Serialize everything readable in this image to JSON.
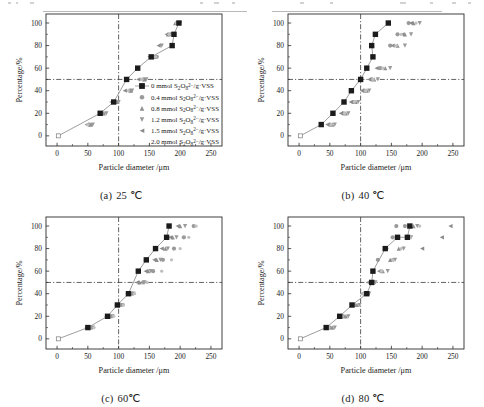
{
  "figure": {
    "type": "multi-panel-scientific-figure",
    "panel_count": 4,
    "layout": "2x2"
  },
  "axis": {
    "xlabel_main": "Particle diameter",
    "xlabel_unit": "/μm",
    "ylabel_main": "Percentage",
    "ylabel_unit": "/%",
    "xticks": [
      "0",
      "50",
      "100",
      "150",
      "200",
      "250"
    ],
    "yticks": [
      "0",
      "20",
      "40",
      "60",
      "80",
      "100"
    ],
    "xlim": [
      -18,
      268
    ],
    "ylim": [
      -9,
      108
    ],
    "ref_line_y": 50,
    "ref_line_x": 100
  },
  "legend": {
    "entries": [
      {
        "marker": "square",
        "color": "#1b1b1b",
        "conc": "0",
        "unit": "mmol",
        "species_a": "S",
        "species_sub1": "2",
        "species_b": "O",
        "species_sub2": "8",
        "species_sup": "2−",
        "per": "/g·VSS",
        "label": "0 mmol S2O8 2- /g·VSS"
      },
      {
        "marker": "circle",
        "color": "#9a9a9a",
        "conc": "0.4",
        "unit": "mmol",
        "species_a": "S",
        "species_sub1": "2",
        "species_b": "O",
        "species_sub2": "8",
        "species_sup": "2−",
        "per": "/g·VSS",
        "label": "0.4 mmol S2O8 2- /g·VSS"
      },
      {
        "marker": "triangle-up",
        "color": "#8f8f8f",
        "conc": "0.8",
        "unit": "mmol",
        "species_a": "S",
        "species_sub1": "2",
        "species_b": "O",
        "species_sub2": "8",
        "species_sup": "2−",
        "per": "/g·VSS",
        "label": "0.8 mmol S2O8 2- /g·VSS"
      },
      {
        "marker": "triangle-down",
        "color": "#9a9a9a",
        "conc": "1.2",
        "unit": "mmol",
        "species_a": "S",
        "species_sub1": "2",
        "species_b": "O",
        "species_sub2": "8",
        "species_sup": "2−",
        "per": "/g·VSS",
        "label": "1.2 mmol S2O8 2- /g·VSS"
      },
      {
        "marker": "triangle-left",
        "color": "#8a8a8a",
        "conc": "1.5",
        "unit": "mmol",
        "species_a": "S",
        "species_sub1": "2",
        "species_b": "O",
        "species_sub2": "8",
        "species_sup": "2−",
        "per": "/g·VSS",
        "label": "1.5 mmol S2O8 2- /g·VSS"
      },
      {
        "marker": "none",
        "color": "#bdbdbd",
        "conc": "2.0",
        "unit": "mmol",
        "species_a": "S",
        "species_sub1": "2",
        "species_b": "O",
        "species_sub2": "8",
        "species_sup": "2−",
        "per": "/g·VSS",
        "label": "2.0 mmol S2O8 2- /g·VSS"
      }
    ]
  },
  "panels": [
    {
      "id": "a",
      "caption_label": "(a)",
      "caption_value": "25 ℃",
      "has_legend": true,
      "chart_data": {
        "type": "line",
        "title": "(a) 25 ℃",
        "xlabel": "Particle diameter /μm",
        "ylabel": "Percentage /%",
        "xlim": [
          -18,
          268
        ],
        "ylim": [
          -9,
          108
        ],
        "grid": false,
        "legend_position": "lower-right-inside",
        "reference_lines": {
          "horizontal_y": 50,
          "vertical_x": 100,
          "style": "dash-dot"
        },
        "series": [
          {
            "name": "0 mmol S2O8 2- /g·VSS",
            "marker": "square",
            "color": "#1b1b1b",
            "connected": true,
            "x": [
              2,
              70,
              92,
              113,
              131,
              153,
              187,
              190,
              198
            ],
            "y": [
              0,
              20,
              30,
              50,
              60,
              70,
              80,
              90,
              100
            ]
          },
          {
            "name": "0.4 mmol S2O8 2- /g·VSS",
            "marker": "circle",
            "color": "#9a9a9a",
            "connected": false,
            "x": [
              52,
              74,
              96,
              118,
              140,
              162,
              184,
              196
            ],
            "y": [
              10,
              20,
              30,
              40,
              50,
              70,
              90,
              100
            ]
          },
          {
            "name": "0.8 mmol S2O8 2- /g·VSS",
            "marker": "triangle-up",
            "color": "#8f8f8f",
            "connected": false,
            "x": [
              55,
              76,
              98,
              120,
              142,
              158,
              180,
              192
            ],
            "y": [
              10,
              20,
              30,
              40,
              50,
              70,
              90,
              100
            ]
          },
          {
            "name": "1.2 mmol S2O8 2- /g·VSS",
            "marker": "triangle-down",
            "color": "#9a9a9a",
            "connected": false,
            "x": [
              58,
              80,
              100,
              122,
              145,
              170,
              188,
              200
            ],
            "y": [
              10,
              20,
              30,
              40,
              50,
              80,
              90,
              100
            ]
          },
          {
            "name": "1.5 mmol S2O8 2- /g·VSS",
            "marker": "triangle-left",
            "color": "#8a8a8a",
            "connected": false,
            "x": [
              48,
              70,
              88,
              110,
              132,
              150,
              165,
              178
            ],
            "y": [
              10,
              20,
              30,
              40,
              50,
              70,
              80,
              90
            ]
          },
          {
            "name": "2.0 mmol S2O8 2- /g·VSS",
            "marker": "dot",
            "color": "#c0c0c0",
            "connected": false,
            "x": [
              50,
              72,
              94,
              116,
              138,
              160,
              182,
              194
            ],
            "y": [
              10,
              20,
              30,
              40,
              50,
              70,
              90,
              100
            ]
          }
        ]
      }
    },
    {
      "id": "b",
      "caption_label": "(b)",
      "caption_value": "40 ℃",
      "has_legend": false,
      "chart_data": {
        "type": "line",
        "title": "(b) 40 ℃",
        "xlabel": "Particle diameter /μm",
        "ylabel": "Percentage /%",
        "xlim": [
          -18,
          268
        ],
        "ylim": [
          -9,
          108
        ],
        "grid": false,
        "reference_lines": {
          "horizontal_y": 50,
          "vertical_x": 100,
          "style": "dash-dot"
        },
        "series": [
          {
            "name": "0 mmol S2O8 2- /g·VSS",
            "marker": "square",
            "color": "#1b1b1b",
            "connected": true,
            "x": [
              2,
              36,
              55,
              73,
              85,
              100,
              110,
              120,
              118,
              124,
              145
            ],
            "y": [
              0,
              10,
              20,
              30,
              40,
              50,
              60,
              70,
              80,
              90,
              100
            ]
          },
          {
            "name": "0.4 mmol S2O8 2- /g·VSS",
            "marker": "circle",
            "color": "#9a9a9a",
            "connected": false,
            "x": [
              50,
              72,
              88,
              106,
              118,
              132,
              148,
              160,
              178
            ],
            "y": [
              10,
              20,
              30,
              40,
              50,
              60,
              80,
              90,
              100
            ]
          },
          {
            "name": "0.8 mmol S2O8 2- /g·VSS",
            "marker": "triangle-up",
            "color": "#8f8f8f",
            "connected": false,
            "x": [
              54,
              76,
              92,
              110,
              122,
              140,
              160,
              172,
              186
            ],
            "y": [
              10,
              20,
              30,
              40,
              50,
              60,
              80,
              90,
              100
            ]
          },
          {
            "name": "1.2 mmol S2O8 2- /g·VSS",
            "marker": "triangle-down",
            "color": "#9a9a9a",
            "connected": false,
            "x": [
              58,
              80,
              96,
              114,
              128,
              148,
              172,
              182,
              196
            ],
            "y": [
              10,
              20,
              30,
              40,
              50,
              60,
              80,
              90,
              100
            ]
          },
          {
            "name": "1.5 mmol S2O8 2- /g·VSS",
            "marker": "triangle-left",
            "color": "#8a8a8a",
            "connected": false,
            "x": [
              46,
              68,
              84,
              102,
              114,
              126,
              152,
              168,
              182
            ],
            "y": [
              10,
              20,
              30,
              40,
              50,
              60,
              80,
              90,
              100
            ]
          },
          {
            "name": "2.0 mmol S2O8 2- /g·VSS",
            "marker": "dot",
            "color": "#c0c0c0",
            "connected": false,
            "x": [
              52,
              74,
              90,
              108,
              120,
              136,
              158,
              166,
              190
            ],
            "y": [
              10,
              20,
              30,
              40,
              50,
              60,
              80,
              90,
              100
            ]
          }
        ]
      }
    },
    {
      "id": "c",
      "caption_label": "(c)",
      "caption_value": "60℃",
      "has_legend": false,
      "chart_data": {
        "type": "line",
        "title": "(c) 60℃",
        "xlabel": "Particle diameter /μm",
        "ylabel": "Percentage /%",
        "xlim": [
          -18,
          268
        ],
        "ylim": [
          -9,
          108
        ],
        "grid": false,
        "reference_lines": {
          "horizontal_y": 50,
          "vertical_x": 100,
          "style": "dash-dot"
        },
        "series": [
          {
            "name": "0 mmol S2O8 2- /g·VSS",
            "marker": "square",
            "color": "#1b1b1b",
            "connected": true,
            "x": [
              2,
              50,
              82,
              98,
              116,
              132,
              145,
              160,
              178,
              182
            ],
            "y": [
              0,
              10,
              20,
              30,
              40,
              60,
              70,
              80,
              90,
              100
            ]
          },
          {
            "name": "0.4 mmol S2O8 2- /g·VSS",
            "marker": "circle",
            "color": "#9a9a9a",
            "connected": false,
            "x": [
              56,
              88,
              104,
              122,
              140,
              156,
              172,
              190,
              206,
              222
            ],
            "y": [
              10,
              20,
              30,
              40,
              50,
              60,
              70,
              80,
              90,
              100
            ]
          },
          {
            "name": "0.8 mmol S2O8 2- /g·VSS",
            "marker": "triangle-up",
            "color": "#8f8f8f",
            "connected": false,
            "x": [
              52,
              84,
              100,
              118,
              134,
              148,
              162,
              176,
              188,
              200
            ],
            "y": [
              10,
              20,
              30,
              40,
              50,
              60,
              70,
              80,
              90,
              100
            ]
          },
          {
            "name": "1.2 mmol S2O8 2- /g·VSS",
            "marker": "triangle-down",
            "color": "#9a9a9a",
            "connected": false,
            "x": [
              58,
              90,
              106,
              124,
              142,
              152,
              168,
              180,
              194,
              208
            ],
            "y": [
              10,
              20,
              30,
              40,
              50,
              60,
              70,
              80,
              90,
              100
            ]
          },
          {
            "name": "1.5 mmol S2O8 2- /g·VSS",
            "marker": "triangle-left",
            "color": "#8a8a8a",
            "connected": false,
            "x": [
              48,
              80,
              96,
              114,
              130,
              144,
              158,
              170,
              184,
              196
            ],
            "y": [
              10,
              20,
              30,
              40,
              50,
              60,
              70,
              80,
              90,
              100
            ]
          },
          {
            "name": "2.0 mmol S2O8 2- /g·VSS",
            "marker": "dot",
            "color": "#c0c0c0",
            "connected": false,
            "x": [
              60,
              92,
              108,
              126,
              146,
              170,
              186,
              200,
              214,
              226
            ],
            "y": [
              10,
              20,
              30,
              40,
              50,
              60,
              70,
              80,
              90,
              100
            ]
          }
        ]
      }
    },
    {
      "id": "d",
      "caption_label": "(d)",
      "caption_value": "80 ℃",
      "has_legend": false,
      "chart_data": {
        "type": "line",
        "title": "(d) 80 ℃",
        "xlabel": "Particle diameter /μm",
        "ylabel": "Percentage /%",
        "xlim": [
          -18,
          268
        ],
        "ylim": [
          -9,
          108
        ],
        "grid": false,
        "reference_lines": {
          "horizontal_y": 50,
          "vertical_x": 100,
          "style": "dash-dot"
        },
        "series": [
          {
            "name": "0 mmol S2O8 2- /g·VSS",
            "marker": "square",
            "color": "#1b1b1b",
            "connected": true,
            "x": [
              2,
              44,
              66,
              86,
              110,
              118,
              120,
              140,
              160,
              176,
              180
            ],
            "y": [
              0,
              10,
              20,
              30,
              40,
              50,
              60,
              80,
              90,
              90,
              100
            ]
          },
          {
            "name": "0.4 mmol S2O8 2- /g·VSS",
            "marker": "circle",
            "color": "#9a9a9a",
            "connected": false,
            "x": [
              50,
              72,
              90,
              106,
              116,
              128,
              142,
              152,
              158,
              172
            ],
            "y": [
              10,
              20,
              30,
              40,
              50,
              70,
              80,
              90,
              100,
              100
            ]
          },
          {
            "name": "0.8 mmol S2O8 2- /g·VSS",
            "marker": "triangle-up",
            "color": "#8f8f8f",
            "connected": false,
            "x": [
              54,
              76,
              94,
              110,
              120,
              136,
              148,
              162,
              176,
              186
            ],
            "y": [
              10,
              20,
              30,
              40,
              50,
              60,
              70,
              80,
              90,
              100
            ]
          },
          {
            "name": "1.2 mmol S2O8 2- /g·VSS",
            "marker": "triangle-down",
            "color": "#9a9a9a",
            "connected": false,
            "x": [
              58,
              80,
              98,
              114,
              124,
              144,
              156,
              170,
              182,
              192
            ],
            "y": [
              10,
              20,
              30,
              40,
              50,
              60,
              70,
              80,
              90,
              100
            ]
          },
          {
            "name": "1.5 mmol S2O8 2- /g·VSS",
            "marker": "triangle-left",
            "color": "#8a8a8a",
            "connected": false,
            "x": [
              46,
              68,
              86,
              102,
              112,
              130,
              150,
              200,
              232,
              246
            ],
            "y": [
              10,
              20,
              30,
              40,
              50,
              60,
              70,
              80,
              90,
              100
            ]
          },
          {
            "name": "2.0 mmol S2O8 2- /g·VSS",
            "marker": "dot",
            "color": "#c0c0c0",
            "connected": false,
            "x": [
              48,
              70,
              88,
              104,
              118,
              134,
              152,
              166,
              180,
              196
            ],
            "y": [
              10,
              20,
              30,
              40,
              50,
              60,
              70,
              80,
              90,
              100
            ]
          }
        ]
      }
    }
  ]
}
